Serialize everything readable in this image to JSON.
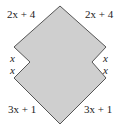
{
  "diagram": {
    "shape": {
      "fill": "#cfcfcf",
      "stroke": "#555555",
      "vertices": [
        [
          60,
          6
        ],
        [
          106,
          47
        ],
        [
          92,
          62
        ],
        [
          106,
          78
        ],
        [
          60,
          124
        ],
        [
          14,
          78
        ],
        [
          30,
          62
        ],
        [
          14,
          47
        ]
      ]
    },
    "labels": {
      "top_left": "2x + 4",
      "top_right": "2x + 4",
      "left_upper": "x",
      "left_lower": "x",
      "right_upper": "x",
      "right_lower": "x",
      "bottom_left": "3x + 1",
      "bottom_right": "3x + 1"
    }
  }
}
